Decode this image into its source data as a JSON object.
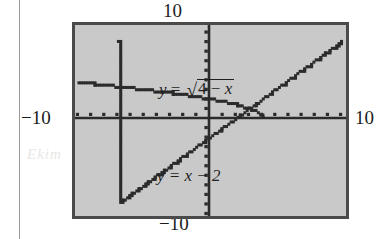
{
  "figure": {
    "kind": "graphing-calculator-screen",
    "frame_color": "#4a4a4a",
    "screen_color": "#c9c9c9",
    "curve_color": "#2b2b2b"
  },
  "axis_labels": {
    "top": "10",
    "bottom": "−10",
    "left": "−10",
    "right": "10"
  },
  "equations": {
    "sqrt": {
      "lhs": "y",
      "eq": "=",
      "radical_sign": "√",
      "radicand_a": "4",
      "radicand_op": "−",
      "radicand_b": "x",
      "full": "y = √(4 − x)"
    },
    "line": {
      "text": "y = x − 2"
    }
  },
  "ghost_text": {
    "left": "\u0000",
    "right": "\u0000"
  },
  "chart_data": {
    "type": "line",
    "title": "",
    "xlabel": "",
    "ylabel": "",
    "xlim": [
      -10,
      10
    ],
    "ylim": [
      -10,
      10
    ],
    "xticks": [
      -10,
      -9,
      -8,
      -7,
      -6,
      -5,
      -4,
      -3,
      -2,
      -1,
      0,
      1,
      2,
      3,
      4,
      5,
      6,
      7,
      8,
      9,
      10
    ],
    "yticks": [
      -10,
      -9,
      -8,
      -7,
      -6,
      -5,
      -4,
      -3,
      -2,
      -1,
      0,
      1,
      2,
      3,
      4,
      5,
      6,
      7,
      8,
      9,
      10
    ],
    "grid": false,
    "legend": "in-plot labels",
    "axis_style": "centered-cross-with-unit-ticks",
    "series": [
      {
        "name": "y = √(4 − x)",
        "expression": "sqrt(4 - x)",
        "domain": [
          -10,
          4
        ],
        "render": "stair-stepped pixel curve",
        "points": [
          {
            "x": -10,
            "y": 3.742
          },
          {
            "x": -9,
            "y": 3.606
          },
          {
            "x": -8,
            "y": 3.464
          },
          {
            "x": -7,
            "y": 3.317
          },
          {
            "x": -6,
            "y": 3.162
          },
          {
            "x": -5,
            "y": 3.0
          },
          {
            "x": -4,
            "y": 2.828
          },
          {
            "x": -3,
            "y": 2.646
          },
          {
            "x": -2,
            "y": 2.449
          },
          {
            "x": -1,
            "y": 2.236
          },
          {
            "x": 0,
            "y": 2.0
          },
          {
            "x": 1,
            "y": 1.732
          },
          {
            "x": 2,
            "y": 1.414
          },
          {
            "x": 3,
            "y": 1.0
          },
          {
            "x": 3.5,
            "y": 0.707
          },
          {
            "x": 3.75,
            "y": 0.5
          },
          {
            "x": 4,
            "y": 0.0
          }
        ]
      },
      {
        "name": "y = x − 2",
        "expression": "x - 2",
        "domain": [
          -7,
          10
        ],
        "render": "stair-stepped pixel line",
        "points": [
          {
            "x": -7,
            "y": -9
          },
          {
            "x": -6,
            "y": -8
          },
          {
            "x": -5,
            "y": -7
          },
          {
            "x": -4,
            "y": -6
          },
          {
            "x": -3,
            "y": -5
          },
          {
            "x": -2,
            "y": -4
          },
          {
            "x": -1,
            "y": -3
          },
          {
            "x": 0,
            "y": -2
          },
          {
            "x": 1,
            "y": -1
          },
          {
            "x": 2,
            "y": 0
          },
          {
            "x": 3,
            "y": 1
          },
          {
            "x": 4,
            "y": 2
          },
          {
            "x": 5,
            "y": 3
          },
          {
            "x": 6,
            "y": 4
          },
          {
            "x": 7,
            "y": 5
          },
          {
            "x": 8,
            "y": 6
          },
          {
            "x": 9,
            "y": 7
          },
          {
            "x": 10,
            "y": 8
          }
        ]
      }
    ],
    "intersection": {
      "x": 3,
      "y": 1,
      "note": "curves cross near x = 3"
    }
  }
}
